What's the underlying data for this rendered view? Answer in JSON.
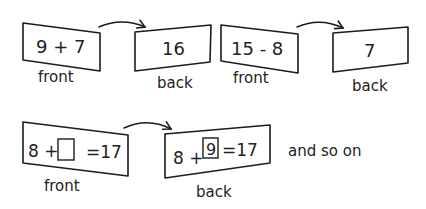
{
  "diagram": {
    "ink_color": "#1c1c1c",
    "background": "#ffffff",
    "rows": [
      {
        "pairs": [
          {
            "front": {
              "expression": "9 + 7",
              "label": "front"
            },
            "back": {
              "expression": "16",
              "label": "back"
            }
          },
          {
            "front": {
              "expression": "15 - 8",
              "label": "front"
            },
            "back": {
              "expression": "7",
              "label": "back"
            }
          }
        ]
      },
      {
        "pairs": [
          {
            "front": {
              "left": "8 +",
              "blank": "",
              "right": "=17",
              "label": "front"
            },
            "back": {
              "left": "8 +",
              "blank": "9",
              "right": "=17",
              "label": "back"
            }
          }
        ],
        "trailing_text": "and so on"
      }
    ]
  }
}
